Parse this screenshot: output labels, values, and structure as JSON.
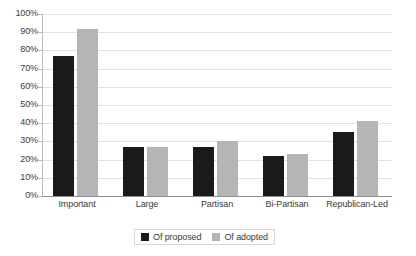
{
  "chart_data": {
    "type": "bar",
    "title": "",
    "subtitle": "",
    "xlabel": "",
    "ylabel": "",
    "ylim": [
      0,
      100
    ],
    "yticks": [
      "0%",
      "10%",
      "20%",
      "30%",
      "40%",
      "50%",
      "60%",
      "70%",
      "80%",
      "90%",
      "100%"
    ],
    "ytick_values": [
      0,
      10,
      20,
      30,
      40,
      50,
      60,
      70,
      80,
      90,
      100
    ],
    "grid": true,
    "legend_position": "bottom-center",
    "categories": [
      "Important",
      "Large",
      "Partisan",
      "Bi-Partisan",
      "Republican-Led"
    ],
    "series": [
      {
        "name": "Of proposed",
        "color": "#1a1a1a",
        "values": [
          77,
          27,
          27,
          22,
          35
        ]
      },
      {
        "name": "Of adopted",
        "color": "#b5b5b5",
        "values": [
          92,
          27,
          30,
          23,
          41
        ]
      }
    ]
  },
  "colors": {
    "background": "#ffffff",
    "gridline": "#e2e2e2",
    "axis": "#8f8f8f",
    "text": "#3b3b3b",
    "legend_border": "#d9d9d9",
    "series_proposed": "#1a1a1a",
    "series_adopted": "#b5b5b5"
  }
}
